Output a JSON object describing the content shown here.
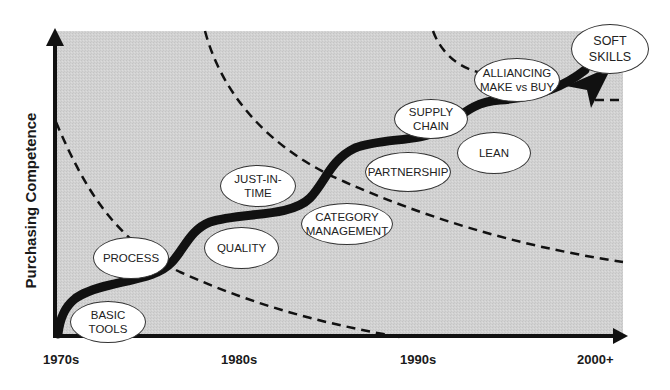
{
  "diagram": {
    "title": "",
    "y_axis_label": "Purchasing Competence",
    "x_axis_ticks": [
      "1970s",
      "1980s",
      "1990s",
      "2000+"
    ],
    "stages": [
      {
        "label": "BASIC\nTOOLS",
        "line1": "BASIC",
        "line2": "TOOLS"
      },
      {
        "label": "PROCESS",
        "line1": "PROCESS",
        "line2": ""
      },
      {
        "label": "QUALITY",
        "line1": "QUALITY",
        "line2": ""
      },
      {
        "label": "JUST-IN-TIME",
        "line1": "JUST-IN-",
        "line2": "TIME"
      },
      {
        "label": "CATEGORY MANAGEMENT",
        "line1": "CATEGORY",
        "line2": "MANAGEMENT"
      },
      {
        "label": "PARTNERSHIP",
        "line1": "PARTNERSHIP",
        "line2": ""
      },
      {
        "label": "SUPPLY CHAIN",
        "line1": "SUPPLY",
        "line2": "CHAIN"
      },
      {
        "label": "LEAN",
        "line1": "LEAN",
        "line2": ""
      },
      {
        "label": "ALLIANCING MAKE vs BUY",
        "line1": "ALLIANCING",
        "line2": "MAKE vs BUY"
      },
      {
        "label": "SOFT SKILLS",
        "line1": "SOFT",
        "line2": "SKILLS"
      }
    ],
    "colors": {
      "plot_background": "#d4d4d4",
      "arrow": "#111111",
      "bubble_fill": "#ffffff",
      "bubble_border": "#333333"
    }
  }
}
